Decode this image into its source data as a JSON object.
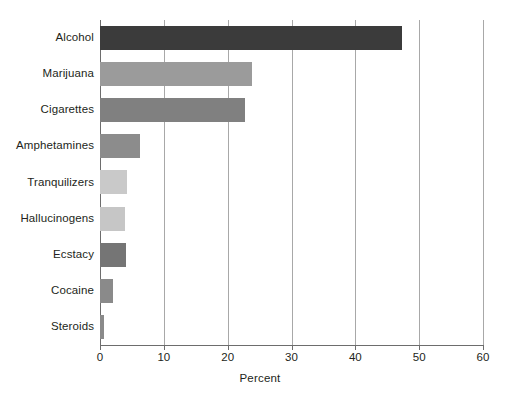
{
  "chart_data": {
    "type": "bar",
    "orientation": "horizontal",
    "title": "",
    "subtitle": "",
    "xlabel": "Percent",
    "ylabel": "",
    "xlim": [
      0,
      60
    ],
    "xticks": [
      0,
      10,
      20,
      30,
      40,
      50,
      60
    ],
    "xtick_labels": [
      "0",
      "10",
      "20",
      "30",
      "40",
      "50",
      "60"
    ],
    "grid": true,
    "grid_axis": "x",
    "legend": false,
    "categories": [
      "Alcohol",
      "Marijuana",
      "Cigarettes",
      "Amphetamines",
      "Tranquilizers",
      "Hallucinogens",
      "Ecstacy",
      "Cocaine",
      "Steroids"
    ],
    "values": [
      47.3,
      23.8,
      22.7,
      6.3,
      4.2,
      3.9,
      4.1,
      2.0,
      0.6
    ],
    "bar_colors": [
      "#3b3b3b",
      "#9b9b9b",
      "#808080",
      "#8c8c8c",
      "#c9c9c9",
      "#c6c6c6",
      "#757575",
      "#8a8a8a",
      "#8a8a8a"
    ],
    "series": [
      {
        "name": "Percent",
        "values": [
          47.3,
          23.8,
          22.7,
          6.3,
          4.2,
          3.9,
          4.1,
          2.0,
          0.6
        ]
      }
    ]
  },
  "axis": {
    "x_title": "Percent"
  },
  "colors": {
    "axis": "#6d6d6d",
    "gridline": "#a8a8a8",
    "text": "#231f20",
    "background": "#ffffff"
  }
}
